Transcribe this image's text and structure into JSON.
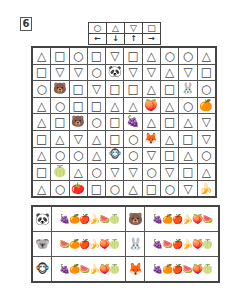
{
  "puzzle_number": "6",
  "icons": {
    "circle": "○",
    "triangle": "△",
    "down-triangle": "▽",
    "square": "□",
    "panda": "🐼",
    "bear": "🐻",
    "rabbit": "🐰",
    "fox": "🦊",
    "monkey": "🐵",
    "peach": "🍑",
    "orange": "🍊",
    "grapes": "🍇",
    "pineapple": "🍍",
    "melon": "🍈",
    "tomato": "🍅",
    "banana": "🍌",
    "apple": "🍎",
    "watermelon": "🍉"
  },
  "legend": {
    "shapes": [
      "○",
      "△",
      "▽",
      "□"
    ],
    "arrows": [
      "←",
      "↓",
      "↑",
      "→"
    ]
  },
  "grid": [
    [
      "△",
      "□",
      "○",
      "□",
      "▽",
      "□",
      "△",
      "○",
      "○",
      "△"
    ],
    [
      "□",
      "▽",
      "▽",
      "○",
      "🐼",
      "▽",
      "▽",
      "△",
      "▽",
      "□"
    ],
    [
      "○",
      "🐻",
      "□",
      "▽",
      "□",
      "□",
      "△",
      "□",
      "🐰",
      "○"
    ],
    [
      "△",
      "○",
      "□",
      "□",
      "△",
      "△",
      "🍑",
      "△",
      "○",
      "🍊"
    ],
    [
      "△",
      "□",
      "🐻",
      "○",
      "□",
      "🍇",
      "△",
      "□",
      "△",
      "▽"
    ],
    [
      "□",
      "△",
      "▽",
      "△",
      "□",
      "○",
      "🦊",
      "△",
      "□",
      "▽"
    ],
    [
      "△",
      "○",
      "○",
      "△",
      "🐵",
      "○",
      "▽",
      "□",
      "△",
      "○"
    ],
    [
      "□",
      "🍈",
      "△",
      "○",
      "▽",
      "▽",
      "○",
      "▽",
      "□",
      "△"
    ],
    [
      "△",
      "○",
      "🍅",
      "□",
      "○",
      "△",
      "□",
      "○",
      "▽",
      "🍌"
    ]
  ],
  "answers": [
    {
      "left_animal": "🐼",
      "left_fruits": "🍇🍊🍎🍌🍉🍈",
      "right_animal": "🐻",
      "right_fruits": "🍇🍊🍎🍌🍑🍉"
    },
    {
      "left_animal": "🐨",
      "left_fruits": "🍉🍊🍎🍌🍑🍈",
      "right_animal": "🐰",
      "right_fruits": "🍇🍉🍎🍌🍑🍈"
    },
    {
      "left_animal": "🐵",
      "left_fruits": "🍇🍊🍉🍌🍑🍈",
      "right_animal": "🦊",
      "right_fruits": "🍇🍊🍎🍉🍑🍈"
    }
  ]
}
